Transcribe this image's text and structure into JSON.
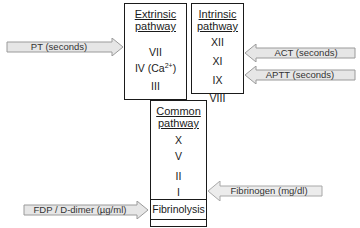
{
  "extrinsic": {
    "title_line1": "Extrinsic",
    "title_line2": "pathway",
    "factors": [
      "VII",
      "IV (Ca",
      "III"
    ],
    "factor_iv_sup": "2+",
    "factor_iv_close": ")"
  },
  "intrinsic": {
    "title_line1": "Intrinsic",
    "title_line2": "pathway",
    "factors": [
      "XII",
      "XI",
      "IX",
      "VIII"
    ]
  },
  "common": {
    "title_line1": "Common",
    "title_line2": "pathway",
    "factors": [
      "X",
      "V",
      "II",
      "I"
    ]
  },
  "fibrinolysis": {
    "label": "Fibrinolysis"
  },
  "tests": {
    "pt": "PT (seconds)",
    "act": "ACT (seconds)",
    "aptt": "APTT (seconds)",
    "fibrinogen": "Fibrinogen (mg/dl)",
    "fdp": "FDP / D-dimer (µg/ml)"
  },
  "colors": {
    "arrow_fill": "#e6e6e6",
    "arrow_stroke": "#9a9a9a",
    "box_border": "#1a1a1a"
  }
}
